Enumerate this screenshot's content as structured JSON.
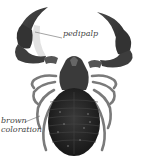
{
  "image": {
    "subject": "pseudoscorpion illustration",
    "style": "grayscale",
    "background": "#ffffff"
  },
  "labels": [
    {
      "id": "pedipalp",
      "text": "pedipalp"
    },
    {
      "id": "brown-coloration",
      "line1": "brown",
      "line2": "coloration"
    }
  ],
  "colors": {
    "body_dark": "#2a2a2a",
    "body_mid": "#555555",
    "legs": "#8a8a8a",
    "label_text": "#444444",
    "leader_line": "#666666"
  }
}
